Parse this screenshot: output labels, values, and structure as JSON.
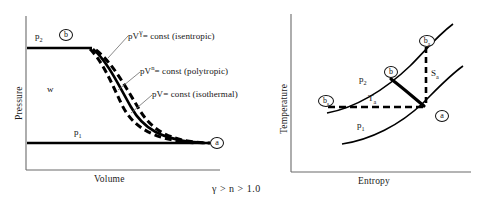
{
  "figure": {
    "caption": "γ > n > 1.0"
  },
  "pv_diagram": {
    "name": "pressure-volume-diagram",
    "xlabel": "Volume",
    "ylabel": "Pressure",
    "work_label": "w",
    "p_high_label": "p",
    "p_high_sub": "2",
    "p_low_label": "p",
    "p_low_sub": "1",
    "point_b": "b",
    "point_a": "a",
    "annotations": [
      {
        "id": "isentropic",
        "base": "pV",
        "exponent": "γ",
        "rest": "= const  (isentropic)"
      },
      {
        "id": "polytropic",
        "base": "pV",
        "exponent": "n",
        "rest": "=  const  (polytropic)"
      },
      {
        "id": "isothermal",
        "base": "pV",
        "exponent": "",
        "rest": "=  const  (isothermal)"
      }
    ]
  },
  "ts_diagram": {
    "name": "temperature-entropy-diagram",
    "xlabel": "Entropy",
    "ylabel": "Temperature",
    "p_high_label": "p",
    "p_high_sub": "2",
    "p_low_label": "p",
    "p_low_sub": "1",
    "temp_label": "T",
    "temp_sub": "a",
    "entropy_label": "S",
    "entropy_sub": "a",
    "point_a": "a",
    "point_b": "b",
    "point_bs_label": "b",
    "point_bs_sub": "s",
    "point_ba_label": "b",
    "point_ba_sub": "a"
  },
  "colors": {
    "ink": "#111111",
    "axis": "#6b6b6b",
    "curve": "#000000"
  }
}
